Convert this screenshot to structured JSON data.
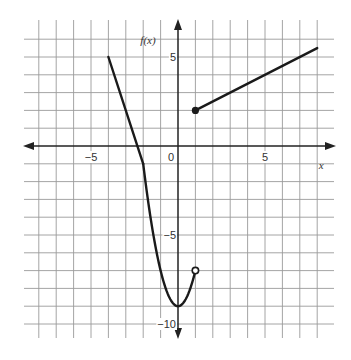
{
  "chart_data": {
    "type": "line",
    "title": "",
    "xlabel": "x",
    "ylabel": "f(x)",
    "xlim": [
      -8,
      8
    ],
    "ylim": [
      -10,
      6
    ],
    "grid": true,
    "grid_step": 1,
    "x_tick_labels": [
      {
        "value": -5,
        "label": "−5"
      },
      {
        "value": 0,
        "label": "0"
      },
      {
        "value": 5,
        "label": "5"
      }
    ],
    "y_tick_labels": [
      {
        "value": 5,
        "label": "5"
      },
      {
        "value": -5,
        "label": "−5"
      },
      {
        "value": -10,
        "label": "−10"
      }
    ],
    "series": [
      {
        "name": "linear-left",
        "kind": "segment",
        "points": [
          [
            -4,
            5
          ],
          [
            -2,
            -1
          ]
        ]
      },
      {
        "name": "parabola",
        "kind": "function",
        "expression": "2x^2 - 9",
        "domain": [
          -2,
          1
        ],
        "points": [
          [
            -2,
            -1
          ],
          [
            -1,
            -7
          ],
          [
            0,
            -9
          ],
          [
            1,
            -7
          ]
        ]
      },
      {
        "name": "linear-right",
        "kind": "segment",
        "points": [
          [
            1,
            2
          ],
          [
            8,
            5.5
          ]
        ]
      }
    ],
    "endpoints": [
      {
        "x": 1,
        "y": -7,
        "style": "open"
      },
      {
        "x": 1,
        "y": 2,
        "style": "closed"
      }
    ],
    "colors": {
      "curve": "#1a1a1a",
      "grid": "#9a9a9a",
      "axis": "#222222"
    }
  }
}
